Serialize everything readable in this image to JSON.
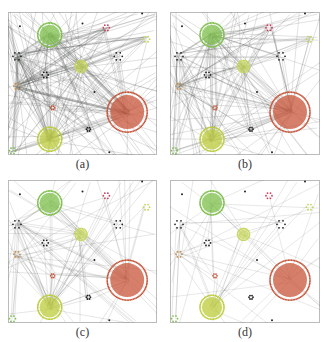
{
  "figure": {
    "panels": [
      {
        "id": "a",
        "label": "(a)",
        "x": 8,
        "y": 12,
        "w": 149,
        "h": 143,
        "edge_density": 1.0
      },
      {
        "id": "b",
        "label": "(b)",
        "x": 170,
        "y": 12,
        "w": 150,
        "h": 143,
        "edge_density": 0.75
      },
      {
        "id": "c",
        "label": "(c)",
        "x": 8,
        "y": 180,
        "w": 149,
        "h": 143,
        "edge_density": 0.45
      },
      {
        "id": "d",
        "label": "(d)",
        "x": 170,
        "y": 180,
        "w": 150,
        "h": 143,
        "edge_density": 0.25
      }
    ],
    "colors": {
      "edge": "#555b55",
      "border": "#bbbbbb",
      "cluster_orange": "#c8553a",
      "cluster_green": "#7cbf4a",
      "cluster_lightgreen": "#bccc3a",
      "cluster_yellowgreen": "#c5d65a",
      "node_black": "#222222",
      "node_pink": "#d04060",
      "node_tan": "#c89050"
    },
    "nodes": [
      {
        "name": "orange-hub",
        "cx": 0.8,
        "cy": 0.7,
        "r": 20,
        "color": "cluster_orange"
      },
      {
        "name": "green-hub",
        "cx": 0.28,
        "cy": 0.16,
        "r": 12,
        "color": "cluster_green"
      },
      {
        "name": "yellow-hub-bottom",
        "cx": 0.28,
        "cy": 0.89,
        "r": 12,
        "color": "cluster_lightgreen"
      },
      {
        "name": "yellow-hub-mid",
        "cx": 0.49,
        "cy": 0.38,
        "r": 6,
        "color": "cluster_yellowgreen"
      },
      {
        "name": "tan-node-left",
        "cx": 0.06,
        "cy": 0.52,
        "r": 3,
        "color": "node_tan"
      },
      {
        "name": "black-cluster-left",
        "cx": 0.06,
        "cy": 0.31,
        "r": 4,
        "color": "node_black"
      },
      {
        "name": "black-cluster-right",
        "cx": 0.74,
        "cy": 0.31,
        "r": 4,
        "color": "node_black"
      },
      {
        "name": "black-cluster-mid",
        "cx": 0.25,
        "cy": 0.44,
        "r": 3,
        "color": "node_black"
      },
      {
        "name": "pink-node",
        "cx": 0.66,
        "cy": 0.11,
        "r": 3,
        "color": "node_pink"
      },
      {
        "name": "yellow-node-right",
        "cx": 0.93,
        "cy": 0.19,
        "r": 3,
        "color": "cluster_yellowgreen"
      },
      {
        "name": "green-node-corner",
        "cx": 0.03,
        "cy": 0.97,
        "r": 3,
        "color": "cluster_green"
      },
      {
        "name": "orange-node-small",
        "cx": 0.3,
        "cy": 0.67,
        "r": 2,
        "color": "cluster_orange"
      },
      {
        "name": "black-dots-bottom",
        "cx": 0.54,
        "cy": 0.82,
        "r": 2,
        "color": "node_black"
      }
    ]
  }
}
